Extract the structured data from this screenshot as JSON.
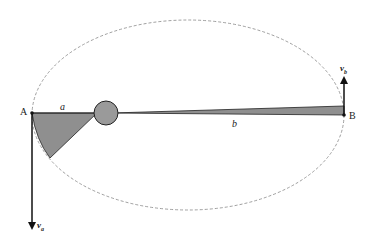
{
  "diagram": {
    "type": "orbit-kepler-second-law",
    "points": [
      {
        "id": "A",
        "label": "A",
        "x": 32,
        "y": 113
      },
      {
        "id": "B",
        "label": "B",
        "x": 344,
        "y": 115
      }
    ],
    "segments": [
      {
        "label": "a",
        "from": "A",
        "to": "focus"
      },
      {
        "label": "b",
        "from": "focus",
        "to": "B"
      }
    ],
    "vectors": [
      {
        "label": "v",
        "subscript": "a",
        "at": "A",
        "direction": "down"
      },
      {
        "label": "v",
        "subscript": "b",
        "at": "B",
        "direction": "up"
      }
    ],
    "central_body": {
      "x": 106,
      "y": 113,
      "r": 12,
      "fill": "#9a9a9a"
    },
    "orbit": {
      "style": "dashed",
      "color": "#888888"
    },
    "sector_fill": "#8f8f8f"
  },
  "labels": {
    "A": "A",
    "B": "B",
    "a": "a",
    "b": "b",
    "va": "v",
    "va_sub": "a",
    "vb": "v",
    "vb_sub": "b"
  }
}
